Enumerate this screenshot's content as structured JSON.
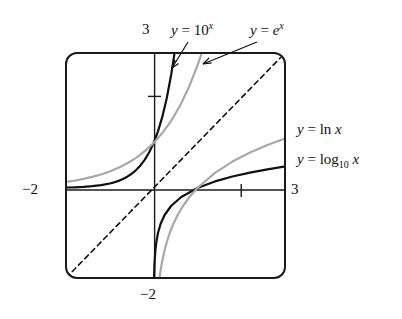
{
  "figure": {
    "kind": "math-graph",
    "background": "#ffffff",
    "frame_color": "#1a1a1a",
    "series_colors": {
      "black": "#111111",
      "gray": "#a8a8a8",
      "dashed": "#111111"
    }
  },
  "labels": {
    "three_top": "3",
    "three_right": "3",
    "minus_two_left": "−2",
    "minus_two_bottom": "−2",
    "exp10": {
      "lead": "y",
      "eq": "=",
      "base": "10",
      "exp": "x"
    },
    "exp_e": {
      "lead": "y",
      "eq": "=",
      "base": "e",
      "exp": "x"
    },
    "ln": {
      "lead": "y",
      "eq": "=",
      "fn": "ln",
      "arg": "x"
    },
    "log10": {
      "lead": "y",
      "eq": "=",
      "fn": "log",
      "sub": "10",
      "arg": "x"
    }
  },
  "chart_data": {
    "type": "line",
    "title": "",
    "xlabel": "",
    "ylabel": "",
    "xlim": [
      -2,
      3
    ],
    "ylim": [
      -2,
      3
    ],
    "grid": false,
    "legend_position": "annotations",
    "axis_ticks": {
      "x": [
        -2,
        2,
        3
      ],
      "y": [
        -2,
        2,
        3
      ],
      "x_tick_labels": [
        "−2",
        "",
        "3"
      ],
      "y_tick_labels": [
        "−2",
        "",
        "3"
      ]
    },
    "annotations": [
      {
        "text": "y = 10^x",
        "target_curve": "10^x",
        "arrow": true
      },
      {
        "text": "y = e^x",
        "target_curve": "e^x",
        "arrow": true
      },
      {
        "text": "y = ln x",
        "target_curve": "ln x",
        "arrow": false
      },
      {
        "text": "y = log_10 x",
        "target_curve": "log_10 x",
        "arrow": false
      }
    ],
    "series": [
      {
        "name": "y = 10^x",
        "color": "#111111",
        "style": "solid",
        "width": 2.2,
        "points": [
          [
            -2.0,
            0.01
          ],
          [
            -1.8,
            0.0158
          ],
          [
            -1.6,
            0.0251
          ],
          [
            -1.4,
            0.0398
          ],
          [
            -1.2,
            0.0631
          ],
          [
            -1.0,
            0.1
          ],
          [
            -0.9,
            0.1259
          ],
          [
            -0.8,
            0.1585
          ],
          [
            -0.7,
            0.1995
          ],
          [
            -0.6,
            0.2512
          ],
          [
            -0.5,
            0.3162
          ],
          [
            -0.4,
            0.3981
          ],
          [
            -0.3,
            0.5012
          ],
          [
            -0.2,
            0.631
          ],
          [
            -0.1,
            0.7943
          ],
          [
            0.0,
            1.0
          ],
          [
            0.1,
            1.2589
          ],
          [
            0.2,
            1.5849
          ],
          [
            0.3,
            1.9953
          ],
          [
            0.4,
            2.5119
          ],
          [
            0.45,
            2.8184
          ],
          [
            0.4771,
            3.0
          ]
        ]
      },
      {
        "name": "y = e^x",
        "color": "#a8a8a8",
        "style": "solid",
        "width": 2.2,
        "points": [
          [
            -2.0,
            0.1353
          ],
          [
            -1.8,
            0.1653
          ],
          [
            -1.6,
            0.2019
          ],
          [
            -1.4,
            0.2466
          ],
          [
            -1.2,
            0.3012
          ],
          [
            -1.0,
            0.3679
          ],
          [
            -0.8,
            0.4493
          ],
          [
            -0.6,
            0.5488
          ],
          [
            -0.4,
            0.6703
          ],
          [
            -0.2,
            0.8187
          ],
          [
            0.0,
            1.0
          ],
          [
            0.2,
            1.2214
          ],
          [
            0.4,
            1.4918
          ],
          [
            0.6,
            1.8221
          ],
          [
            0.8,
            2.2255
          ],
          [
            1.0,
            2.7183
          ],
          [
            1.0986,
            3.0
          ]
        ]
      },
      {
        "name": "y = log_10 x",
        "color": "#111111",
        "style": "solid",
        "width": 2.2,
        "points": [
          [
            0.01,
            -2.0
          ],
          [
            0.0158,
            -1.8
          ],
          [
            0.0251,
            -1.6
          ],
          [
            0.0398,
            -1.4
          ],
          [
            0.0631,
            -1.2
          ],
          [
            0.1,
            -1.0
          ],
          [
            0.1585,
            -0.8
          ],
          [
            0.2512,
            -0.6
          ],
          [
            0.3981,
            -0.4
          ],
          [
            0.631,
            -0.2
          ],
          [
            1.0,
            0.0
          ],
          [
            1.4,
            0.1461
          ],
          [
            1.8,
            0.2553
          ],
          [
            2.2,
            0.3424
          ],
          [
            2.6,
            0.415
          ],
          [
            3.0,
            0.4771
          ]
        ]
      },
      {
        "name": "y = ln x",
        "color": "#a8a8a8",
        "style": "solid",
        "width": 2.2,
        "points": [
          [
            0.1353,
            -2.0
          ],
          [
            0.1653,
            -1.8
          ],
          [
            0.2019,
            -1.6
          ],
          [
            0.2466,
            -1.4
          ],
          [
            0.3012,
            -1.2
          ],
          [
            0.3679,
            -1.0
          ],
          [
            0.4493,
            -0.8
          ],
          [
            0.5488,
            -0.6
          ],
          [
            0.6703,
            -0.4
          ],
          [
            0.8187,
            -0.2
          ],
          [
            1.0,
            0.0
          ],
          [
            1.4,
            0.3365
          ],
          [
            1.8,
            0.5878
          ],
          [
            2.2,
            0.7885
          ],
          [
            2.6,
            0.9555
          ],
          [
            3.0,
            1.0986
          ]
        ]
      },
      {
        "name": "y = x",
        "color": "#111111",
        "style": "dashed",
        "width": 1.6,
        "points": [
          [
            -2.0,
            -2.0
          ],
          [
            3.0,
            3.0
          ]
        ]
      }
    ]
  }
}
